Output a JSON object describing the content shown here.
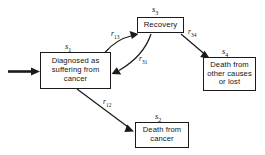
{
  "diagram": {
    "type": "state-transition-diagram",
    "title": "",
    "background_color": "#ffffff",
    "stroke_color": "#1b1b1b",
    "text_color": "#141414",
    "nodes": [
      {
        "id": "s1",
        "state_label": "s",
        "state_subscript": "1",
        "text": "Diagnosed as\nsuffering from\ncancer"
      },
      {
        "id": "s3",
        "state_label": "s",
        "state_subscript": "3",
        "text": "Recovery"
      },
      {
        "id": "s4",
        "state_label": "s",
        "state_subscript": "4",
        "text": "Death from\nother causes\nor lost"
      },
      {
        "id": "s2",
        "state_label": "s",
        "state_subscript": "2",
        "text": "Death from\ncancer"
      }
    ],
    "edges": [
      {
        "id": "entry",
        "from": "external",
        "to": "s1",
        "rate_label": "",
        "rate_subscript": "",
        "style": "thick-straight"
      },
      {
        "id": "r13",
        "from": "s1",
        "to": "s3",
        "rate_label": "r",
        "rate_subscript": "13",
        "style": "curved"
      },
      {
        "id": "r31",
        "from": "s3",
        "to": "s1",
        "rate_label": "r",
        "rate_subscript": "31",
        "style": "curved"
      },
      {
        "id": "r34",
        "from": "s3",
        "to": "s4",
        "rate_label": "r",
        "rate_subscript": "34",
        "style": "straight"
      },
      {
        "id": "r12",
        "from": "s1",
        "to": "s2",
        "rate_label": "r",
        "rate_subscript": "12",
        "style": "straight"
      }
    ]
  }
}
